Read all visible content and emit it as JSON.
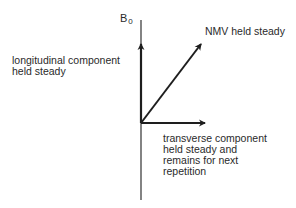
{
  "diagram": {
    "axis_label": {
      "main": "B",
      "subscript": "0"
    },
    "labels": {
      "longitudinal": [
        "longitudinal component",
        "held steady"
      ],
      "nmv": "NMV held steady",
      "transverse": [
        "transverse component",
        "held steady and",
        "remains for next",
        "repetition"
      ]
    },
    "vectors": [
      {
        "name": "longitudinal",
        "direction": "up"
      },
      {
        "name": "nmv",
        "direction": "diagonal-up-right"
      },
      {
        "name": "transverse",
        "direction": "right"
      }
    ],
    "colors": {
      "line": "#1e1e1e",
      "text": "#2a2a2a",
      "background": "#ffffff"
    }
  }
}
